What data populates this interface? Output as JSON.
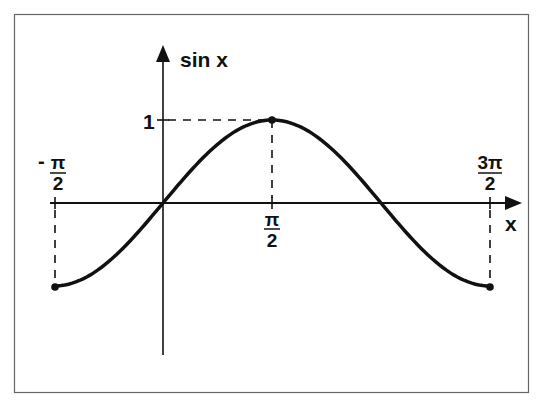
{
  "chart_data": {
    "type": "line",
    "title": "",
    "xlabel": "x",
    "ylabel": "sin x",
    "function": "sin(x)",
    "x_range": [
      "-π/2",
      "3π/2"
    ],
    "x_numeric_range": [
      -1.5708,
      4.7124
    ],
    "y_range": [
      -1,
      1
    ],
    "x_tick_labels": [
      {
        "num": "π",
        "den": "2",
        "prefix": "-",
        "value": -1.5708
      },
      {
        "num": "π",
        "den": "2",
        "prefix": "",
        "value": 1.5708
      },
      {
        "num": "3π",
        "den": "2",
        "prefix": "",
        "value": 4.7124
      }
    ],
    "y_tick_labels": [
      {
        "label": "1",
        "value": 1
      }
    ],
    "series": [
      {
        "name": "sin x",
        "x": [
          -1.5708,
          -0.7854,
          0,
          0.7854,
          1.5708,
          2.3562,
          3.1416,
          3.927,
          4.7124
        ],
        "values": [
          -1,
          -0.7071,
          0,
          0.7071,
          1,
          0.7071,
          0,
          -0.7071,
          -1
        ]
      }
    ],
    "marked_points": [
      {
        "x": -1.5708,
        "y": -1
      },
      {
        "x": 1.5708,
        "y": 1
      },
      {
        "x": 4.7124,
        "y": -1
      }
    ],
    "guides": "dashed lines from (π/2,1) to both axes; dashed verticals at x=-π/2 and x=3π/2",
    "grid": false,
    "legend": null
  },
  "labels": {
    "y_axis": "sin x",
    "x_axis": "x",
    "y_tick_one": "1",
    "neg_pi_half_sign": "-",
    "neg_pi_half_num": "π",
    "neg_pi_half_den": "2",
    "pi_half_num": "π",
    "pi_half_den": "2",
    "three_pi_half_num": "3π",
    "three_pi_half_den": "2"
  },
  "colors": {
    "ink": "#111111",
    "frame": "#666666",
    "background": "#ffffff"
  }
}
